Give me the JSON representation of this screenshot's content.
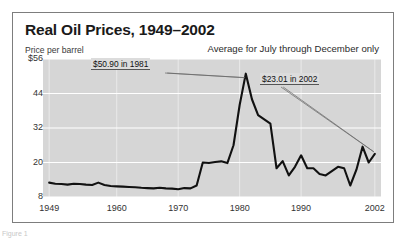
{
  "figure": {
    "title": "Real Oil Prices, 1949–2002",
    "subtitle": "Average for July through December only",
    "axis_note": "Price per barrel",
    "credit": "Figure 1",
    "plot_bg_color": "#d6d6d6",
    "gridline_color": "#ffffff",
    "line_color": "#111111",
    "border_color": "#7d7d7d"
  },
  "annotations": {
    "peak": {
      "label": "$50.90 in 1981",
      "value": 50.9,
      "year": 1981
    },
    "end": {
      "label": "$23.01 in 2002",
      "value": 23.01,
      "year": 2002
    }
  },
  "chart_data": {
    "type": "line",
    "title": "Real Oil Prices, 1949–2002",
    "subtitle": "Average for July through December only",
    "xlabel": "",
    "ylabel": "Price per barrel",
    "xlim": [
      1948,
      2003
    ],
    "ylim": [
      8,
      56
    ],
    "yticks": [
      8,
      20,
      32,
      44,
      56
    ],
    "ytick_labels": [
      "8",
      "20",
      "32",
      "44",
      "$56"
    ],
    "xticks": [
      1949,
      1960,
      1970,
      1980,
      1990,
      2002
    ],
    "xtick_labels": [
      "1949",
      "1960",
      "1970",
      "1980",
      "1990",
      "2002"
    ],
    "grid": true,
    "legend": null,
    "series": [
      {
        "name": "Real oil price (per barrel)",
        "x": [
          1949,
          1950,
          1951,
          1952,
          1953,
          1954,
          1955,
          1956,
          1957,
          1958,
          1959,
          1960,
          1961,
          1962,
          1963,
          1964,
          1965,
          1966,
          1967,
          1968,
          1969,
          1970,
          1971,
          1972,
          1973,
          1974,
          1975,
          1976,
          1977,
          1978,
          1979,
          1980,
          1981,
          1982,
          1983,
          1984,
          1985,
          1986,
          1987,
          1988,
          1989,
          1990,
          1991,
          1992,
          1993,
          1994,
          1995,
          1996,
          1997,
          1998,
          1999,
          2000,
          2001,
          2002
        ],
        "values": [
          13.0,
          12.6,
          12.5,
          12.3,
          12.6,
          12.5,
          12.3,
          12.2,
          13.0,
          12.2,
          11.8,
          11.7,
          11.6,
          11.5,
          11.4,
          11.2,
          11.1,
          11.0,
          11.2,
          11.0,
          10.9,
          10.7,
          11.1,
          11.0,
          12.0,
          20.0,
          19.8,
          20.2,
          20.4,
          19.8,
          26.0,
          40.0,
          50.9,
          42.0,
          36.5,
          35.0,
          33.5,
          18.0,
          20.5,
          15.5,
          18.5,
          22.5,
          18.0,
          18.0,
          16.0,
          15.5,
          17.0,
          18.5,
          18.0,
          12.0,
          17.5,
          25.5,
          20.0,
          23.01
        ],
        "units": "US dollars per barrel"
      }
    ]
  }
}
